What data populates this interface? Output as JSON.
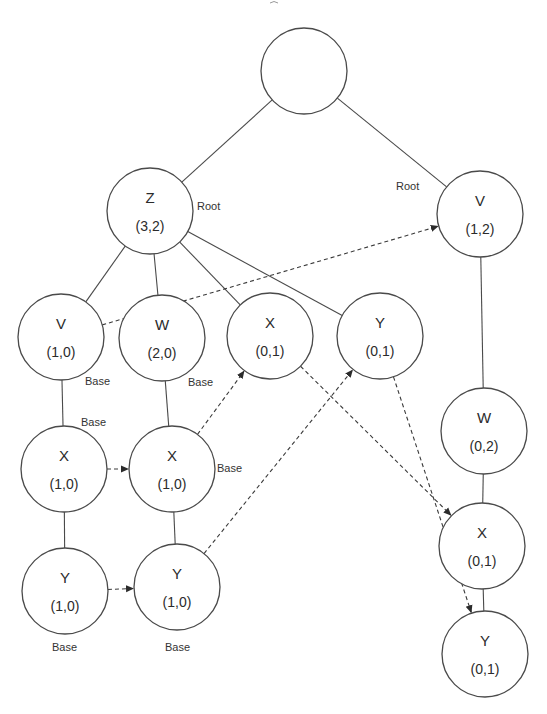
{
  "diagram": {
    "type": "tree-with-links",
    "colors": {
      "stroke": "#4a4a4a",
      "text": "#2b2b2b",
      "background": "#ffffff"
    },
    "node_radius": 43,
    "nodes": [
      {
        "id": "top",
        "name": "",
        "value": "",
        "x": 304,
        "y": 71
      },
      {
        "id": "Z",
        "name": "Z",
        "value": "(3,2)",
        "x": 150,
        "y": 211
      },
      {
        "id": "V12",
        "name": "V",
        "value": "(1,2)",
        "x": 480,
        "y": 214
      },
      {
        "id": "V10",
        "name": "V",
        "value": "(1,0)",
        "x": 61,
        "y": 337
      },
      {
        "id": "W20",
        "name": "W",
        "value": "(2,0)",
        "x": 162,
        "y": 338
      },
      {
        "id": "X01a",
        "name": "X",
        "value": "(0,1)",
        "x": 270,
        "y": 336
      },
      {
        "id": "Y01a",
        "name": "Y",
        "value": "(0,1)",
        "x": 380,
        "y": 336
      },
      {
        "id": "X10a",
        "name": "X",
        "value": "(1,0)",
        "x": 64,
        "y": 469
      },
      {
        "id": "X10b",
        "name": "X",
        "value": "(1,0)",
        "x": 172,
        "y": 469
      },
      {
        "id": "Y10a",
        "name": "Y",
        "value": "(1,0)",
        "x": 65,
        "y": 591
      },
      {
        "id": "Y10b",
        "name": "Y",
        "value": "(1,0)",
        "x": 177,
        "y": 587
      },
      {
        "id": "W02",
        "name": "W",
        "value": "(0,2)",
        "x": 484,
        "y": 431
      },
      {
        "id": "X01b",
        "name": "X",
        "value": "(0,1)",
        "x": 482,
        "y": 546
      },
      {
        "id": "Y01b",
        "name": "Y",
        "value": "(0,1)",
        "x": 485,
        "y": 654
      }
    ],
    "tree_edges": [
      {
        "from": "top",
        "to": "Z"
      },
      {
        "from": "top",
        "to": "V12"
      },
      {
        "from": "Z",
        "to": "V10"
      },
      {
        "from": "Z",
        "to": "W20"
      },
      {
        "from": "Z",
        "to": "X01a"
      },
      {
        "from": "Z",
        "to": "Y01a"
      },
      {
        "from": "V10",
        "to": "X10a"
      },
      {
        "from": "X10a",
        "to": "Y10a"
      },
      {
        "from": "W20",
        "to": "X10b"
      },
      {
        "from": "X10b",
        "to": "Y10b"
      },
      {
        "from": "V12",
        "to": "W02"
      },
      {
        "from": "W02",
        "to": "X01b"
      },
      {
        "from": "X01b",
        "to": "Y01b"
      }
    ],
    "link_edges": [
      {
        "from": "V10",
        "to": "V12"
      },
      {
        "from": "X10a",
        "to": "X10b"
      },
      {
        "from": "Y10a",
        "to": "Y10b"
      },
      {
        "from": "X10b",
        "to": "X01a"
      },
      {
        "from": "Y10b",
        "to": "Y01a"
      },
      {
        "from": "X01a",
        "to": "X01b"
      },
      {
        "from": "Y01a",
        "to": "Y01b"
      }
    ],
    "labels": [
      {
        "text": "Root",
        "x": 197,
        "y": 210
      },
      {
        "text": "Root",
        "x": 396,
        "y": 190
      },
      {
        "text": "Base",
        "x": 85,
        "y": 385
      },
      {
        "text": "Base",
        "x": 188,
        "y": 386
      },
      {
        "text": "Base",
        "x": 81,
        "y": 426
      },
      {
        "text": "Base",
        "x": 217,
        "y": 472
      },
      {
        "text": "Base",
        "x": 52,
        "y": 651
      },
      {
        "text": "Base",
        "x": 165,
        "y": 651
      }
    ]
  }
}
